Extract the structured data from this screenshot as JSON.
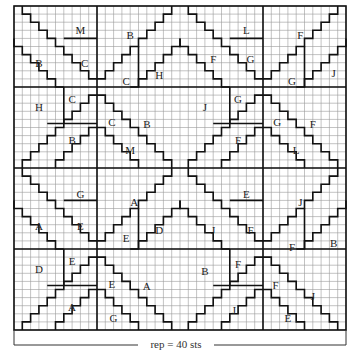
{
  "chart": {
    "title": "",
    "grid": {
      "cols": 40,
      "rows": 40,
      "x0": 14,
      "y0": 6,
      "cell_w": 8.3,
      "cell_h": 8.1
    },
    "colors": {
      "grid": "#9a9a9a",
      "line": "#111111",
      "bg": "#ffffff"
    },
    "footer": {
      "label": "rep = 40 sts"
    }
  },
  "labels": [
    {
      "t": "M",
      "c": 8,
      "r": 3
    },
    {
      "t": "B",
      "c": 14,
      "r": 3.6
    },
    {
      "t": "B",
      "c": 3,
      "r": 7
    },
    {
      "t": "C",
      "c": 8.5,
      "r": 7
    },
    {
      "t": "H",
      "c": 17.5,
      "r": 8.5
    },
    {
      "t": "C",
      "c": 13.5,
      "r": 9.3
    },
    {
      "t": "C",
      "c": 7,
      "r": 11.5
    },
    {
      "t": "H",
      "c": 3,
      "r": 12.5
    },
    {
      "t": "C",
      "c": 11.8,
      "r": 14.3
    },
    {
      "t": "B",
      "c": 16,
      "r": 14.6
    },
    {
      "t": "B",
      "c": 7,
      "r": 16.5
    },
    {
      "t": "M",
      "c": 14,
      "r": 17.8
    },
    {
      "t": "L",
      "c": 28,
      "r": 3
    },
    {
      "t": "F",
      "c": 34.5,
      "r": 3.6
    },
    {
      "t": "F",
      "c": 24,
      "r": 6.5
    },
    {
      "t": "G",
      "c": 28.5,
      "r": 6.5
    },
    {
      "t": "J",
      "c": 38.5,
      "r": 8.3
    },
    {
      "t": "G",
      "c": 33.5,
      "r": 9.3
    },
    {
      "t": "J",
      "c": 23,
      "r": 12.5
    },
    {
      "t": "G",
      "c": 27,
      "r": 11.5
    },
    {
      "t": "G",
      "c": 31.7,
      "r": 14.3
    },
    {
      "t": "F",
      "c": 36,
      "r": 14.6
    },
    {
      "t": "F",
      "c": 27,
      "r": 16.5
    },
    {
      "t": "L",
      "c": 34,
      "r": 17.8
    },
    {
      "t": "G",
      "c": 8,
      "r": 23.2
    },
    {
      "t": "A",
      "c": 14.5,
      "r": 24.2
    },
    {
      "t": "A",
      "c": 3,
      "r": 27.2
    },
    {
      "t": "E",
      "c": 8,
      "r": 27.2
    },
    {
      "t": "D",
      "c": 17.5,
      "r": 27.6
    },
    {
      "t": "E",
      "c": 13.5,
      "r": 28.6
    },
    {
      "t": "E",
      "c": 7,
      "r": 31.5
    },
    {
      "t": "D",
      "c": 3,
      "r": 32.5
    },
    {
      "t": "E",
      "c": 11.8,
      "r": 34.3
    },
    {
      "t": "A",
      "c": 16,
      "r": 34.6
    },
    {
      "t": "A",
      "c": 7,
      "r": 37.2
    },
    {
      "t": "G",
      "c": 12,
      "r": 38.5
    },
    {
      "t": "E",
      "c": 28,
      "r": 23.2
    },
    {
      "t": "J",
      "c": 34.5,
      "r": 24.2
    },
    {
      "t": "J",
      "c": 24,
      "r": 27.6
    },
    {
      "t": "F",
      "c": 28.5,
      "r": 27.6
    },
    {
      "t": "B",
      "c": 38.5,
      "r": 29.3
    },
    {
      "t": "F",
      "c": 33.5,
      "r": 29.8
    },
    {
      "t": "B",
      "c": 23,
      "r": 32.7
    },
    {
      "t": "F",
      "c": 27,
      "r": 31.8
    },
    {
      "t": "F",
      "c": 31.5,
      "r": 34.5
    },
    {
      "t": "J",
      "c": 36,
      "r": 35.8
    },
    {
      "t": "J",
      "c": 26.5,
      "r": 37.5
    },
    {
      "t": "E",
      "c": 33,
      "r": 38.5
    }
  ]
}
